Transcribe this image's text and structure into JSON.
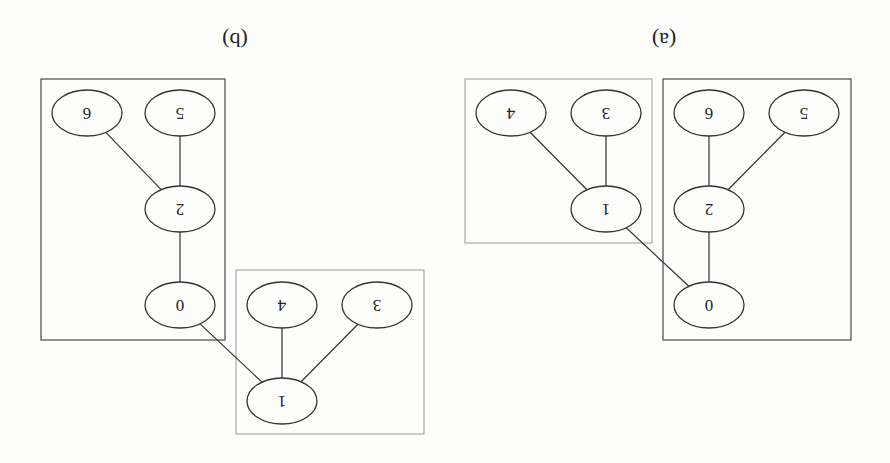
{
  "figure": {
    "orientation": "rotated 180 degrees",
    "colors": {
      "line": "#333333",
      "cluster_dark": "#555555",
      "cluster_light": "#9a9a9a",
      "text": "#222222"
    },
    "panels": [
      {
        "id": "b",
        "label": "(b)",
        "label_pos": [
          235,
          40
        ],
        "clusters": [
          {
            "id": "b-cluster-main",
            "nodes": [
              "0",
              "2",
              "5",
              "6"
            ],
            "rect": [
              41,
              79,
              184,
              261
            ],
            "style": "dark"
          },
          {
            "id": "b-cluster-small",
            "nodes": [
              "1",
              "3",
              "4"
            ],
            "rect": [
              236,
              270,
              188,
              164
            ],
            "style": "light"
          }
        ],
        "nodes": [
          {
            "id": "6",
            "label": "6",
            "cx": 87,
            "cy": 113
          },
          {
            "id": "5",
            "label": "5",
            "cx": 180,
            "cy": 113
          },
          {
            "id": "2",
            "label": "2",
            "cx": 180,
            "cy": 209
          },
          {
            "id": "0",
            "label": "0",
            "cx": 180,
            "cy": 305
          },
          {
            "id": "4",
            "label": "4",
            "cx": 282,
            "cy": 305
          },
          {
            "id": "3",
            "label": "3",
            "cx": 377,
            "cy": 305
          },
          {
            "id": "1",
            "label": "1",
            "cx": 282,
            "cy": 401
          }
        ],
        "edges": [
          [
            "2",
            "6"
          ],
          [
            "2",
            "5"
          ],
          [
            "0",
            "2"
          ],
          [
            "0",
            "1"
          ],
          [
            "1",
            "4"
          ],
          [
            "1",
            "3"
          ]
        ]
      },
      {
        "id": "a",
        "label": "(a)",
        "label_pos": [
          664,
          40
        ],
        "clusters": [
          {
            "id": "a-cluster-main",
            "nodes": [
              "0",
              "2",
              "5",
              "6"
            ],
            "rect": [
              663,
              79,
              188,
              261
            ],
            "style": "dark"
          },
          {
            "id": "a-cluster-small",
            "nodes": [
              "1",
              "3",
              "4"
            ],
            "rect": [
              465,
              79,
              187,
              164
            ],
            "style": "light"
          }
        ],
        "nodes": [
          {
            "id": "6",
            "label": "6",
            "cx": 709,
            "cy": 113
          },
          {
            "id": "5",
            "label": "5",
            "cx": 804,
            "cy": 113
          },
          {
            "id": "2",
            "label": "2",
            "cx": 709,
            "cy": 209
          },
          {
            "id": "0",
            "label": "0",
            "cx": 709,
            "cy": 305
          },
          {
            "id": "4",
            "label": "4",
            "cx": 511,
            "cy": 113
          },
          {
            "id": "3",
            "label": "3",
            "cx": 606,
            "cy": 113
          },
          {
            "id": "1",
            "label": "1",
            "cx": 606,
            "cy": 209
          }
        ],
        "edges": [
          [
            "2",
            "6"
          ],
          [
            "2",
            "5"
          ],
          [
            "0",
            "2"
          ],
          [
            "0",
            "1"
          ],
          [
            "1",
            "4"
          ],
          [
            "1",
            "3"
          ]
        ]
      }
    ],
    "node_rx": 35,
    "node_ry": 23
  }
}
